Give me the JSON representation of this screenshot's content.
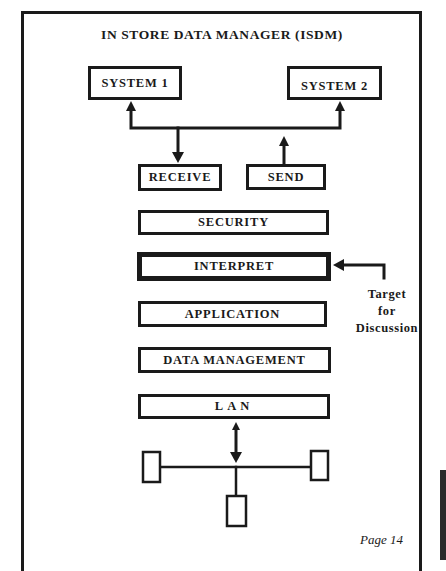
{
  "title": "IN STORE DATA MANAGER (ISDM)",
  "systems": [
    {
      "label": "SYSTEM 1"
    },
    {
      "label": "SYSTEM 2"
    }
  ],
  "io": {
    "receive": "RECEIVE",
    "send": "SEND"
  },
  "layers": [
    {
      "label": "SECURITY",
      "highlighted": false
    },
    {
      "label": "INTERPRET",
      "highlighted": true
    },
    {
      "label": "APPLICATION",
      "highlighted": false
    },
    {
      "label": "DATA MANAGEMENT",
      "highlighted": false
    },
    {
      "label": "LAN",
      "highlighted": false
    }
  ],
  "annotation": {
    "line1": "Target",
    "line2": "for",
    "line3": "Discussion",
    "points_to": "INTERPRET"
  },
  "network": {
    "nodes": 3,
    "topology": "bus"
  },
  "footer": {
    "page": "Page 14"
  },
  "colors": {
    "ink": "#1a1a1a",
    "paper": "#ffffff"
  }
}
